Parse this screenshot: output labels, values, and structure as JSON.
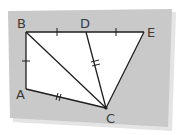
{
  "diagram": {
    "type": "geometry-figure",
    "colors": {
      "card": "#c9c9c9",
      "card_shadow": "#e2e2e2",
      "fill": "#ffffff",
      "stroke": "#1e1e1e",
      "label": "#3a3a3a"
    },
    "points": {
      "B": {
        "label": "B",
        "x": 26,
        "y": 32
      },
      "D": {
        "label": "D",
        "x": 86,
        "y": 32
      },
      "E": {
        "label": "E",
        "x": 144,
        "y": 32
      },
      "A": {
        "label": "A",
        "x": 26,
        "y": 89
      },
      "C": {
        "label": "C",
        "x": 106,
        "y": 108
      }
    },
    "segments": [
      {
        "from": "B",
        "to": "E"
      },
      {
        "from": "E",
        "to": "C"
      },
      {
        "from": "B",
        "to": "A"
      },
      {
        "from": "A",
        "to": "C"
      },
      {
        "from": "B",
        "to": "C"
      },
      {
        "from": "D",
        "to": "C"
      }
    ],
    "congruence_marks": [
      {
        "segment": "BD",
        "ticks": 1
      },
      {
        "segment": "DE",
        "ticks": 1
      },
      {
        "segment": "AB",
        "ticks": 1
      },
      {
        "segment": "DC",
        "ticks": 2
      },
      {
        "segment": "AC",
        "ticks": 2
      }
    ]
  }
}
